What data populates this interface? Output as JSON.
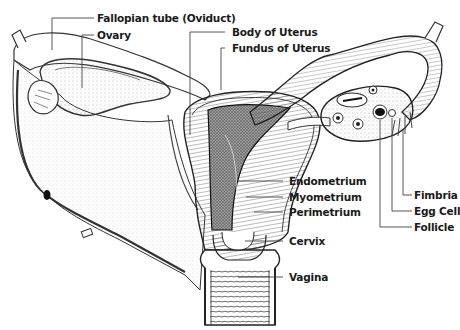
{
  "labels": {
    "fallopian_tube": "Fallopian tube (Oviduct)",
    "ovary": "Ovary",
    "body_of_uterus": "Body of Uterus",
    "fundus_of_uterus": "Fundus of Uterus",
    "fimbria": "Fimbria",
    "egg_cell": "Egg Cell",
    "follicle": "Follicle",
    "endometrium": "Endometrium",
    "myometrium": "Myometrium",
    "perimetrium": "Perimetrium",
    "cervix": "Cervix",
    "vagina": "Vagina"
  },
  "colors": {
    "line": "#222222",
    "stipple": "#8a8a8a",
    "cavity": "#6e6e6e",
    "background": "#ffffff"
  }
}
